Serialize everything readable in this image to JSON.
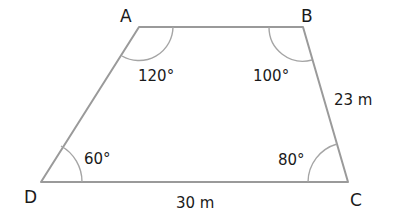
{
  "figure": {
    "type": "trapezium-quadrilateral",
    "vertices": [
      {
        "name": "A",
        "label": "A",
        "angle": "120°"
      },
      {
        "name": "B",
        "label": "B",
        "angle": "100°"
      },
      {
        "name": "C",
        "label": "C",
        "angle": "80°"
      },
      {
        "name": "D",
        "label": "D",
        "angle": "60°"
      }
    ],
    "sides": [
      {
        "from": "B",
        "to": "C",
        "length_label": "23 m"
      },
      {
        "from": "D",
        "to": "C",
        "length_label": "30 m"
      }
    ]
  },
  "labels": {
    "A": "A",
    "B": "B",
    "C": "C",
    "D": "D",
    "angle_A": "120°",
    "angle_B": "100°",
    "angle_C": "80°",
    "angle_D": "60°",
    "side_BC": "23 m",
    "side_DC": "30 m"
  },
  "colors": {
    "edge": "#9a9a9a",
    "text": "#1a1a1a",
    "background": "#ffffff"
  }
}
